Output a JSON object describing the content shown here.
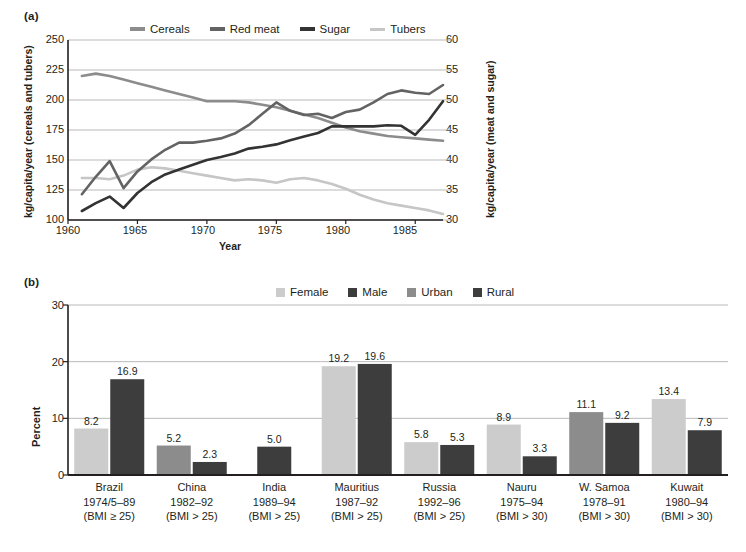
{
  "figure": {
    "panel_a_tag": "(a)",
    "panel_b_tag": "(b)"
  },
  "panel_a": {
    "legend": [
      {
        "label": "Cereals",
        "color": "#8c8c8c"
      },
      {
        "label": "Red meat",
        "color": "#636363"
      },
      {
        "label": "Sugar",
        "color": "#333333"
      },
      {
        "label": "Tubers",
        "color": "#c6c6c6"
      }
    ],
    "y_left_title": "kg/capita/year (cereals and tubers)",
    "y_right_title": "kg/capita/year (meat and sugar)",
    "x_title": "Year",
    "y_left_ticks": [
      "100",
      "125",
      "150",
      "175",
      "200",
      "225",
      "250"
    ],
    "y_right_ticks": [
      "30",
      "35",
      "40",
      "45",
      "50",
      "55",
      "60"
    ],
    "x_ticks": [
      "1960",
      "1965",
      "1970",
      "1975",
      "1980",
      "1985"
    ]
  },
  "panel_b": {
    "legend": [
      {
        "label": "Female",
        "color": "#cccccc"
      },
      {
        "label": "Male",
        "color": "#3d3d3d"
      },
      {
        "label": "Urban",
        "color": "#8c8c8c"
      },
      {
        "label": "Rural",
        "color": "#3d3d3d"
      }
    ],
    "y_title": "Percent",
    "y_ticks": [
      "0",
      "10",
      "20",
      "30"
    ]
  },
  "chart_data": [
    {
      "type": "line",
      "panel": "(a)",
      "title": "",
      "xlabel": "Year",
      "ylabel": "kg/capita/year (cereals and tubers)",
      "y2label": "kg/capita/year (meat and sugar)",
      "xlim": [
        1960,
        1987
      ],
      "ylim": [
        100,
        250
      ],
      "y2lim": [
        30,
        60
      ],
      "grid": true,
      "legend_position": "top",
      "x": [
        1961,
        1962,
        1963,
        1964,
        1965,
        1966,
        1967,
        1968,
        1969,
        1970,
        1971,
        1972,
        1973,
        1974,
        1975,
        1976,
        1977,
        1978,
        1979,
        1980,
        1981,
        1982,
        1983,
        1984,
        1985,
        1986,
        1987
      ],
      "series": [
        {
          "name": "Cereals",
          "axis": "left",
          "units": "kg/capita/year",
          "color": "#8c8c8c",
          "values": [
            220,
            222,
            220,
            217,
            214,
            211,
            208,
            205,
            202,
            199,
            199,
            199,
            198,
            196,
            194,
            191,
            188,
            185,
            181,
            177,
            174,
            172,
            170,
            169,
            168,
            167,
            166
          ]
        },
        {
          "name": "Tubers",
          "axis": "left",
          "units": "kg/capita/year",
          "color": "#c6c6c6",
          "values": [
            135,
            135,
            134,
            137,
            142,
            144,
            143,
            141,
            139,
            137,
            135,
            133,
            134,
            133,
            131,
            134,
            135,
            133,
            130,
            126,
            121,
            117,
            114,
            112,
            110,
            108,
            105
          ]
        },
        {
          "name": "Red meat",
          "axis": "right",
          "units": "kg/capita/year",
          "color": "#636363",
          "values": [
            34.3,
            37.2,
            39.8,
            35.3,
            38.1,
            40.1,
            41.7,
            42.9,
            42.9,
            43.2,
            43.6,
            44.4,
            45.8,
            47.7,
            49.6,
            48.2,
            47.5,
            47.7,
            47.0,
            48.0,
            48.4,
            49.6,
            51.0,
            51.6,
            51.2,
            51.0,
            52.5
          ]
        },
        {
          "name": "Sugar",
          "axis": "right",
          "units": "kg/capita/year",
          "color": "#333333",
          "values": [
            31.5,
            32.8,
            33.9,
            32.0,
            34.5,
            36.3,
            37.6,
            38.4,
            39.2,
            40.0,
            40.5,
            41.1,
            41.9,
            42.2,
            42.6,
            43.3,
            43.9,
            44.5,
            45.6,
            45.6,
            45.6,
            45.6,
            45.8,
            45.7,
            44.2,
            46.7,
            49.8
          ]
        }
      ]
    },
    {
      "type": "bar",
      "panel": "(b)",
      "title": "",
      "xlabel": "",
      "ylabel": "Percent",
      "ylim": [
        0,
        30
      ],
      "yticks": [
        0,
        10,
        20,
        30
      ],
      "grid": true,
      "legend_position": "top",
      "categories": [
        {
          "name": "Brazil",
          "period": "1974/5–89",
          "criterion": "(BMI ≥ 25)"
        },
        {
          "name": "China",
          "period": "1982–92",
          "criterion": "(BMI > 25)"
        },
        {
          "name": "India",
          "period": "1989–94",
          "criterion": "(BMI > 25)"
        },
        {
          "name": "Mauritius",
          "period": "1987–92",
          "criterion": "(BMI > 25)"
        },
        {
          "name": "Russia",
          "period": "1992–96",
          "criterion": "(BMI > 25)"
        },
        {
          "name": "Nauru",
          "period": "1975–94",
          "criterion": "(BMI > 30)"
        },
        {
          "name": "W. Samoa",
          "period": "1978–91",
          "criterion": "(BMI > 30)"
        },
        {
          "name": "Kuwait",
          "period": "1980–94",
          "criterion": "(BMI > 30)"
        }
      ],
      "bars": [
        {
          "category": "Brazil",
          "series": "Female",
          "value": 8.2,
          "label": "8.2",
          "color": "#cccccc"
        },
        {
          "category": "Brazil",
          "series": "Male",
          "value": 16.9,
          "label": "16.9",
          "color": "#3d3d3d"
        },
        {
          "category": "China",
          "series": "Urban",
          "value": 5.2,
          "label": "5.2",
          "color": "#8c8c8c"
        },
        {
          "category": "China",
          "series": "Rural",
          "value": 2.3,
          "label": "2.3",
          "color": "#3d3d3d"
        },
        {
          "category": "India",
          "series": "Rural",
          "value": 5.0,
          "label": "5.0",
          "color": "#3d3d3d"
        },
        {
          "category": "Mauritius",
          "series": "Female",
          "value": 19.2,
          "label": "19.2",
          "color": "#cccccc"
        },
        {
          "category": "Mauritius",
          "series": "Male",
          "value": 19.6,
          "label": "19.6",
          "color": "#3d3d3d"
        },
        {
          "category": "Russia",
          "series": "Female",
          "value": 5.8,
          "label": "5.8",
          "color": "#cccccc"
        },
        {
          "category": "Russia",
          "series": "Male",
          "value": 5.3,
          "label": "5.3",
          "color": "#3d3d3d"
        },
        {
          "category": "Nauru",
          "series": "Female",
          "value": 8.9,
          "label": "8.9",
          "color": "#cccccc"
        },
        {
          "category": "Nauru",
          "series": "Male",
          "value": 3.3,
          "label": "3.3",
          "color": "#3d3d3d"
        },
        {
          "category": "W. Samoa",
          "series": "Urban",
          "value": 11.1,
          "label": "11.1",
          "color": "#8c8c8c"
        },
        {
          "category": "W. Samoa",
          "series": "Rural",
          "value": 9.2,
          "label": "9.2",
          "color": "#3d3d3d"
        },
        {
          "category": "Kuwait",
          "series": "Female",
          "value": 13.4,
          "label": "13.4",
          "color": "#cccccc"
        },
        {
          "category": "Kuwait",
          "series": "Male",
          "value": 7.9,
          "label": "7.9",
          "color": "#3d3d3d"
        }
      ]
    }
  ]
}
